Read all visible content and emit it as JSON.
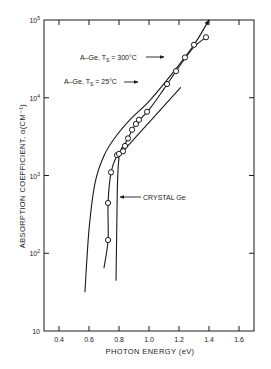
{
  "chart_data": {
    "type": "line",
    "title": "",
    "xlabel": "PHOTON ENERGY (eV)",
    "ylabel": "ABSORPTION COEFFICIENT, α(CM⁻¹)",
    "xscale": "linear",
    "yscale": "log",
    "xlim": [
      0.3,
      1.7
    ],
    "ylim": [
      10,
      100000
    ],
    "grid": false,
    "x_ticks": [
      0.4,
      0.6,
      0.8,
      1.0,
      1.2,
      1.4,
      1.6
    ],
    "x_tick_labels": [
      "0.4",
      "0.6",
      "0.8",
      "1.0",
      "1.2",
      "1.4",
      "1.6"
    ],
    "y_ticks": [
      10,
      100,
      1000,
      10000,
      100000
    ],
    "y_tick_labels": [
      {
        "base": "10",
        "exp": ""
      },
      {
        "base": "10",
        "exp": "2"
      },
      {
        "base": "10",
        "exp": "3"
      },
      {
        "base": "10",
        "exp": "4"
      },
      {
        "base": "10",
        "exp": "5"
      }
    ],
    "series": [
      {
        "name": "A-Ge, TS = 300°C",
        "label_main": "A–Ge, T",
        "label_sub": "S",
        "label_tail": " = 300°C",
        "style": "solid curve",
        "points": [
          [
            0.573,
            32
          ],
          [
            0.6,
            200
          ],
          [
            0.64,
            800
          ],
          [
            0.7,
            1800
          ],
          [
            0.78,
            3200
          ],
          [
            0.88,
            5400
          ],
          [
            1.0,
            9000
          ],
          [
            1.15,
            20000
          ],
          [
            1.3,
            48000
          ],
          [
            1.4,
            100000
          ]
        ]
      },
      {
        "name": "A-Ge, TS = 25°C",
        "label_main": "A–Ge, T",
        "label_sub": "S",
        "label_tail": " = 25°C",
        "style": "solid curve with circle markers",
        "curve": [
          [
            0.7,
            65
          ],
          [
            0.727,
            148
          ],
          [
            0.727,
            443
          ],
          [
            0.747,
            1100
          ],
          [
            0.787,
            1830
          ],
          [
            0.813,
            2050
          ],
          [
            0.86,
            3000
          ],
          [
            0.913,
            4600
          ],
          [
            1.0,
            7000
          ],
          [
            1.1,
            13000
          ],
          [
            1.2,
            25000
          ],
          [
            1.3,
            45000
          ],
          [
            1.38,
            60000
          ]
        ],
        "tangent_line": [
          [
            0.8,
            1800
          ],
          [
            1.21,
            13500
          ]
        ],
        "markers": [
          {
            "x": 0.727,
            "y": 148
          },
          {
            "x": 0.727,
            "y": 443
          },
          {
            "x": 0.747,
            "y": 1100
          },
          {
            "x": 0.787,
            "y": 1830
          },
          {
            "x": 0.8,
            "y": 1900
          },
          {
            "x": 0.827,
            "y": 2050
          },
          {
            "x": 0.84,
            "y": 2400
          },
          {
            "x": 0.86,
            "y": 3000
          },
          {
            "x": 0.887,
            "y": 3880
          },
          {
            "x": 0.913,
            "y": 4600
          },
          {
            "x": 0.933,
            "y": 5200
          },
          {
            "x": 0.987,
            "y": 6600
          },
          {
            "x": 1.12,
            "y": 15000
          },
          {
            "x": 1.18,
            "y": 22000
          },
          {
            "x": 1.24,
            "y": 33000
          },
          {
            "x": 1.3,
            "y": 48000
          },
          {
            "x": 1.38,
            "y": 60000
          }
        ]
      },
      {
        "name": "CRYSTAL Ge",
        "label_main": "CRYSTAL Ge",
        "style": "solid curve",
        "points": [
          [
            0.78,
            45
          ],
          [
            0.785,
            200
          ],
          [
            0.79,
            800
          ],
          [
            0.8,
            1700
          ],
          [
            0.82,
            2300
          ]
        ]
      }
    ],
    "annotations": [
      {
        "text": "A–Ge, TS = 300°C",
        "arrow_to": [
          1.12,
          15000
        ]
      },
      {
        "text": "A–Ge, TS = 25°C",
        "arrow_to": [
          0.93,
          6300
        ]
      },
      {
        "text": "CRYSTAL Ge",
        "arrow_to": [
          0.787,
          330
        ]
      }
    ]
  }
}
